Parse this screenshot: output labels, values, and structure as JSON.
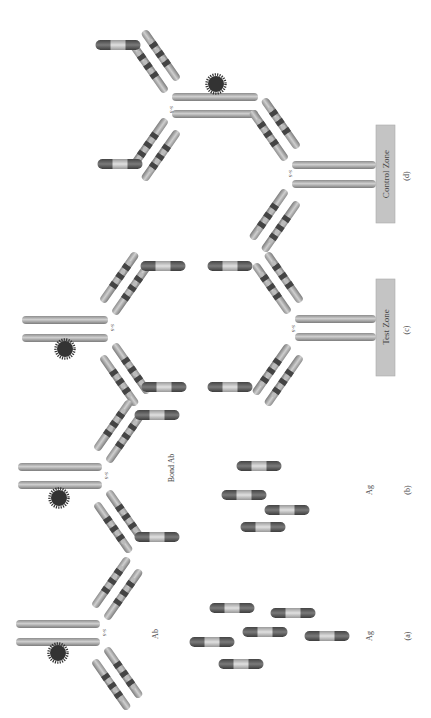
{
  "figure": {
    "orientation": "rotated-90-clockwise",
    "background": "#ffffff",
    "colors": {
      "heavy_chain": "#a9a9a9",
      "light_segment": "#c8c8c8",
      "dark_segment": "#555555",
      "antigen_end": "#5a5a5a",
      "antigen_middle": "#bdbdbd",
      "label_particle": "#3a3a3a",
      "zone_fill": "#c4c4c4",
      "text": "#444444"
    },
    "panels": [
      {
        "id": "a",
        "label": "(a)",
        "antibody_label": "Ab",
        "antigen_label": "Ag"
      },
      {
        "id": "b",
        "label": "(b)",
        "antibody_label": "Bond Ab",
        "antigen_label": "Ag"
      },
      {
        "id": "c",
        "label": "(c)",
        "zone_label": "Test Zone"
      },
      {
        "id": "d",
        "label": "(d)",
        "zone_label": "Control Zone"
      }
    ],
    "bond_label": "S-S"
  }
}
